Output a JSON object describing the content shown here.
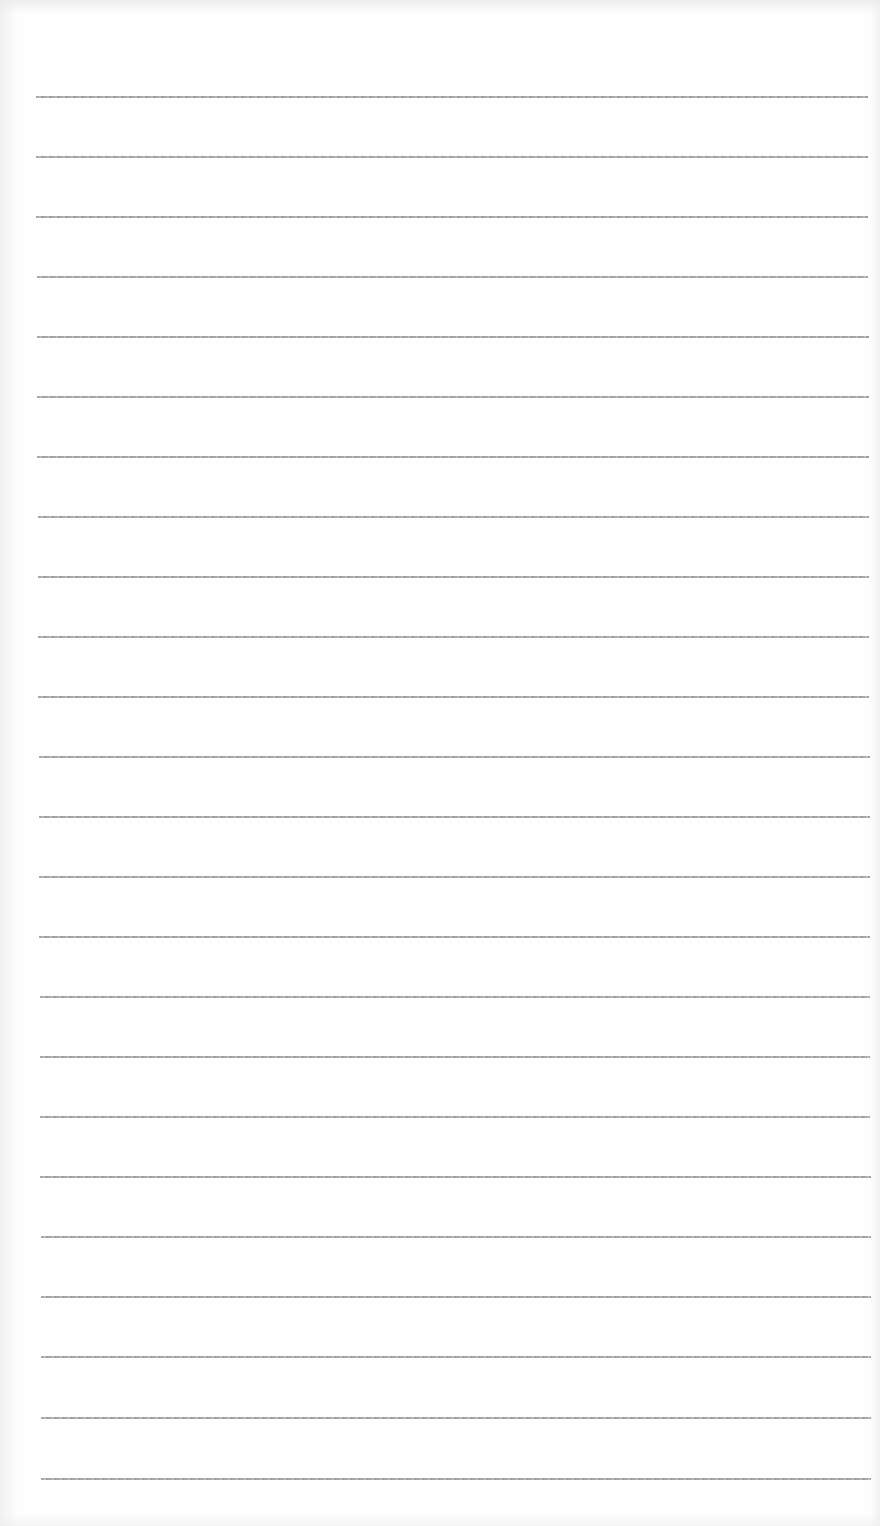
{
  "document": {
    "type": "lined-paper",
    "line_count": 24,
    "line_color": "#9a9a9a",
    "background_color": "#fefefe",
    "text": ""
  },
  "lines": [
    {
      "y": 97,
      "x1": 36,
      "x2": 868
    },
    {
      "y": 157,
      "x1": 36,
      "x2": 868
    },
    {
      "y": 217,
      "x1": 36,
      "x2": 868
    },
    {
      "y": 277,
      "x1": 37,
      "x2": 868
    },
    {
      "y": 337,
      "x1": 37,
      "x2": 869
    },
    {
      "y": 397,
      "x1": 37,
      "x2": 869
    },
    {
      "y": 457,
      "x1": 37,
      "x2": 869
    },
    {
      "y": 517,
      "x1": 38,
      "x2": 869
    },
    {
      "y": 577,
      "x1": 38,
      "x2": 869
    },
    {
      "y": 637,
      "x1": 38,
      "x2": 869
    },
    {
      "y": 697,
      "x1": 38,
      "x2": 869
    },
    {
      "y": 757,
      "x1": 39,
      "x2": 870
    },
    {
      "y": 817,
      "x1": 39,
      "x2": 870
    },
    {
      "y": 877,
      "x1": 39,
      "x2": 870
    },
    {
      "y": 937,
      "x1": 39,
      "x2": 870
    },
    {
      "y": 997,
      "x1": 40,
      "x2": 870
    },
    {
      "y": 1057,
      "x1": 40,
      "x2": 870
    },
    {
      "y": 1117,
      "x1": 40,
      "x2": 870
    },
    {
      "y": 1177,
      "x1": 40,
      "x2": 871
    },
    {
      "y": 1237,
      "x1": 41,
      "x2": 871
    },
    {
      "y": 1297,
      "x1": 41,
      "x2": 871
    },
    {
      "y": 1357,
      "x1": 41,
      "x2": 871
    },
    {
      "y": 1418,
      "x1": 41,
      "x2": 871
    },
    {
      "y": 1479,
      "x1": 41,
      "x2": 871
    }
  ]
}
